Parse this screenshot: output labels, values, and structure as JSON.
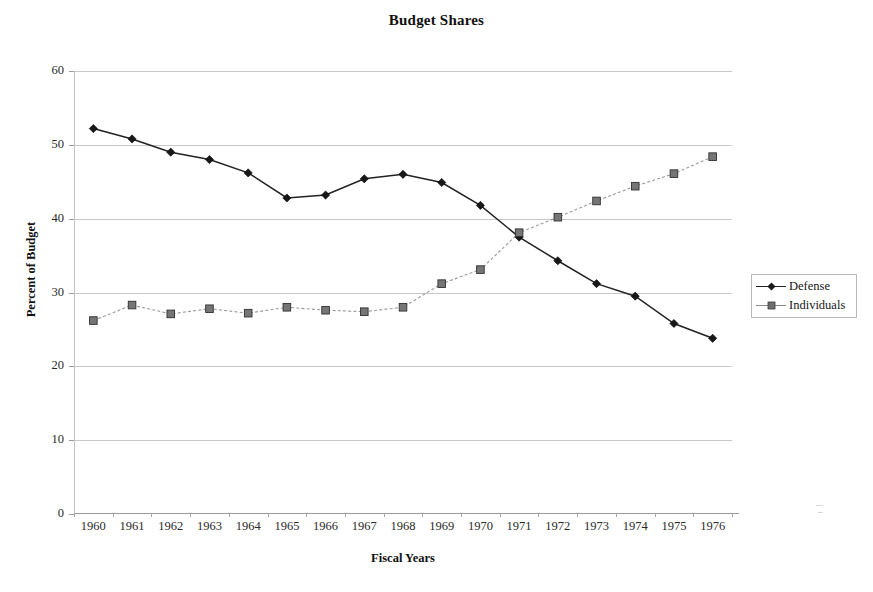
{
  "chart_data": {
    "type": "line",
    "title": "Budget Shares",
    "xlabel": "Fiscal Years",
    "ylabel": "Percent of Budget",
    "categories": [
      "1960",
      "1961",
      "1962",
      "1963",
      "1964",
      "1965",
      "1966",
      "1967",
      "1968",
      "1969",
      "1970",
      "1971",
      "1972",
      "1973",
      "1974",
      "1975",
      "1976"
    ],
    "yticks": [
      0,
      10,
      20,
      30,
      40,
      50,
      60
    ],
    "ylim": [
      0,
      60
    ],
    "grid": true,
    "legend_position": "right",
    "series": [
      {
        "name": "Defense",
        "marker": "diamond",
        "linestyle": "solid",
        "color": "#222222",
        "values": [
          52.2,
          50.8,
          49.0,
          48.0,
          46.2,
          42.8,
          43.2,
          45.4,
          46.0,
          44.9,
          41.8,
          37.5,
          34.3,
          31.2,
          29.5,
          25.8,
          23.8
        ]
      },
      {
        "name": "Individuals",
        "marker": "square",
        "linestyle": "dashed",
        "color": "#6e6e6e",
        "values": [
          26.2,
          28.3,
          27.1,
          27.8,
          27.2,
          28.0,
          27.6,
          27.4,
          28.0,
          31.2,
          33.1,
          38.1,
          40.2,
          42.4,
          44.4,
          46.1,
          48.4
        ]
      }
    ]
  },
  "legend": {
    "items": [
      {
        "label": "Defense"
      },
      {
        "label": "Individuals"
      }
    ]
  }
}
